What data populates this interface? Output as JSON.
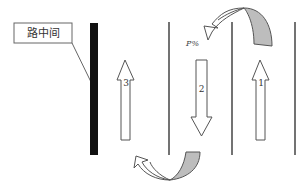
{
  "diagram": {
    "callout_label": "路中间",
    "percent_label": "P%",
    "lanes": [
      {
        "number": "3",
        "direction": "up"
      },
      {
        "number": "2",
        "direction": "down"
      },
      {
        "number": "1",
        "direction": "up"
      }
    ],
    "colors": {
      "median": "#111111",
      "lane_line": "#444444",
      "u_turn_shade": "#bdbdbd"
    }
  }
}
